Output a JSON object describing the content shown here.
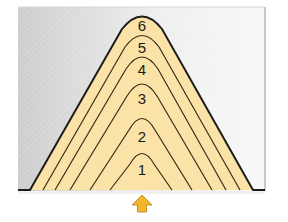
{
  "diagram": {
    "type": "layered-cone-cross-section",
    "colors": {
      "fill": "#fbe2a6",
      "outline": "#1c1c1c",
      "inner_lines": "#3a2e1a",
      "background_left": "#cfcfcf",
      "background_right": "#f7f7f7",
      "arrow": "#f3b52a",
      "arrow_outline": "#8a6a1c"
    },
    "layers": [
      {
        "label": "1"
      },
      {
        "label": "2"
      },
      {
        "label": "3"
      },
      {
        "label": "4"
      },
      {
        "label": "5"
      },
      {
        "label": "6"
      }
    ],
    "arrow": {
      "direction": "up",
      "icon": "up-arrow-icon"
    }
  }
}
